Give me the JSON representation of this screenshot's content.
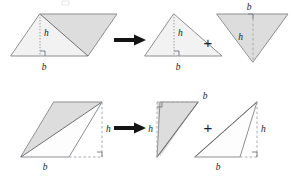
{
  "figure": {
    "rows": [
      {
        "id": "row-right-parallelogram",
        "source_shape": "parallelogram",
        "operator_arrow": "→",
        "operator_plus": "+",
        "labels": {
          "base": "b",
          "height": "h"
        },
        "result_shapes": [
          {
            "id": "triangle-upright",
            "orientation": "upright",
            "shaded": false,
            "base_label": "b",
            "height_label": "h"
          },
          {
            "id": "triangle-inverted",
            "orientation": "inverted",
            "shaded": true,
            "base_label": "b",
            "height_label": "h"
          }
        ]
      },
      {
        "id": "row-oblique-parallelogram",
        "source_shape": "parallelogram",
        "operator_arrow": "→",
        "operator_plus": "+",
        "labels": {
          "base": "b",
          "height": "h"
        },
        "result_shapes": [
          {
            "id": "triangle-shaded-oblique",
            "orientation": "oblique-upper",
            "shaded": true,
            "base_label": "b",
            "height_label": "h"
          },
          {
            "id": "triangle-white-oblique",
            "orientation": "oblique-lower",
            "shaded": false,
            "base_label": "b",
            "height_label": "h"
          }
        ]
      }
    ],
    "symbols": {
      "arrow": "→",
      "plus": "+",
      "right_angle": "right-angle-marker"
    },
    "colors": {
      "shade_light": "#f2f2f2",
      "shade_mid": "#dddddd",
      "outline": "#8d8f92",
      "text": "#1b1b1b",
      "arrow": "#141414"
    },
    "text_labels": {
      "r1_par_h": "h",
      "r1_par_b": "b",
      "r1_tri1_h": "h",
      "r1_tri1_b": "b",
      "r1_tri2_h": "h",
      "r1_tri2_b": "b",
      "r1_plus": "+",
      "r2_par_h": "h",
      "r2_par_b": "b",
      "r2_tri1_h": "h",
      "r2_tri1_b": "b",
      "r2_tri2_h": "h",
      "r2_tri2_b": "b",
      "r2_plus": "+"
    }
  }
}
